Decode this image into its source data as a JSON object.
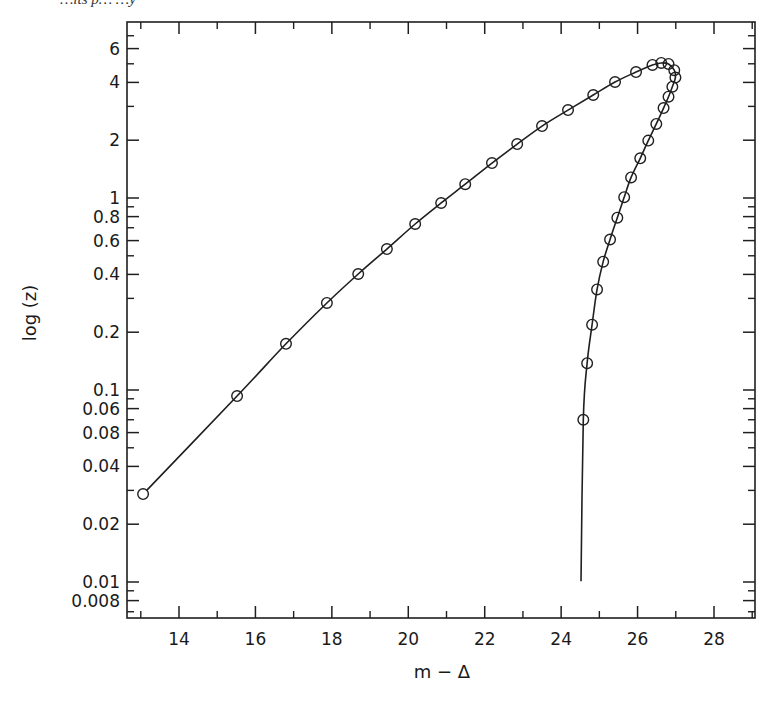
{
  "caption": "…its p…        …y",
  "chart_data": {
    "type": "line",
    "title": "",
    "xlabel": "m − Δ",
    "ylabel": "log (z)",
    "xlim": [
      12.6,
      29.1
    ],
    "ylim": [
      0.0063,
      7.6
    ],
    "yscale": "log",
    "grid": false,
    "legend": null,
    "x_ticks": [
      14,
      16,
      18,
      20,
      22,
      24,
      26,
      28
    ],
    "x_tick_labels": [
      "14",
      "16",
      "18",
      "20",
      "22",
      "24",
      "26",
      "28"
    ],
    "x_minor_ticks": [
      13,
      15,
      17,
      19,
      21,
      23,
      25,
      27,
      29
    ],
    "y_ticks": [
      {
        "value": 6,
        "label": "6"
      },
      {
        "value": 4,
        "label": "4"
      },
      {
        "value": 2,
        "label": "2"
      },
      {
        "value": 1,
        "label": "1"
      },
      {
        "value": 0.8,
        "label": "0.8"
      },
      {
        "value": 0.6,
        "label": "0.6"
      },
      {
        "value": 0.4,
        "label": "0.4"
      },
      {
        "value": 0.2,
        "label": "0.2"
      },
      {
        "value": 0.1,
        "label": "0.1"
      },
      {
        "value": 0.08,
        "label": "0.06"
      },
      {
        "value": 0.06,
        "label": "0.08"
      },
      {
        "value": 0.04,
        "label": "0.04"
      },
      {
        "value": 0.02,
        "label": "0.02"
      },
      {
        "value": 0.01,
        "label": "0.01"
      },
      {
        "value": 0.008,
        "label": "0.008"
      }
    ],
    "y_minor_ticks": [
      7,
      5,
      3,
      0.9,
      0.7,
      0.5,
      0.3,
      0.09,
      0.07,
      0.05,
      0.03,
      0.009,
      0.007
    ],
    "series": [
      {
        "name": "curve",
        "style": "solid line with open circle markers",
        "points": [
          {
            "x": 13.06,
            "y": 0.0287,
            "marker": true
          },
          {
            "x": 15.52,
            "y": 0.093,
            "marker": true
          },
          {
            "x": 16.8,
            "y": 0.174,
            "marker": true
          },
          {
            "x": 17.87,
            "y": 0.284,
            "marker": true
          },
          {
            "x": 18.69,
            "y": 0.402,
            "marker": true
          },
          {
            "x": 19.44,
            "y": 0.542,
            "marker": true
          },
          {
            "x": 20.18,
            "y": 0.732,
            "marker": true
          },
          {
            "x": 20.86,
            "y": 0.942,
            "marker": true
          },
          {
            "x": 21.49,
            "y": 1.18,
            "marker": true
          },
          {
            "x": 22.19,
            "y": 1.52,
            "marker": true
          },
          {
            "x": 22.85,
            "y": 1.91,
            "marker": true
          },
          {
            "x": 23.5,
            "y": 2.37,
            "marker": true
          },
          {
            "x": 24.18,
            "y": 2.87,
            "marker": true
          },
          {
            "x": 24.84,
            "y": 3.44,
            "marker": true
          },
          {
            "x": 25.41,
            "y": 4.02,
            "marker": true
          },
          {
            "x": 25.96,
            "y": 4.53,
            "marker": true
          },
          {
            "x": 26.39,
            "y": 4.93,
            "marker": true
          },
          {
            "x": 26.62,
            "y": 5.05,
            "marker": true
          },
          {
            "x": 26.81,
            "y": 4.99,
            "marker": true
          },
          {
            "x": 26.96,
            "y": 4.63,
            "marker": true
          },
          {
            "x": 26.99,
            "y": 4.24,
            "marker": true
          },
          {
            "x": 26.91,
            "y": 3.8,
            "marker": true
          },
          {
            "x": 26.81,
            "y": 3.37,
            "marker": true
          },
          {
            "x": 26.68,
            "y": 2.94,
            "marker": true
          },
          {
            "x": 26.49,
            "y": 2.43,
            "marker": true
          },
          {
            "x": 26.28,
            "y": 1.99,
            "marker": true
          },
          {
            "x": 26.07,
            "y": 1.61,
            "marker": true
          },
          {
            "x": 25.83,
            "y": 1.28,
            "marker": true
          },
          {
            "x": 25.65,
            "y": 1.01,
            "marker": true
          },
          {
            "x": 25.47,
            "y": 0.79,
            "marker": true
          },
          {
            "x": 25.28,
            "y": 0.608,
            "marker": true
          },
          {
            "x": 25.1,
            "y": 0.466,
            "marker": true
          },
          {
            "x": 24.94,
            "y": 0.334,
            "marker": true
          },
          {
            "x": 24.81,
            "y": 0.219,
            "marker": true
          },
          {
            "x": 24.68,
            "y": 0.138,
            "marker": true
          },
          {
            "x": 24.58,
            "y": 0.07,
            "marker": true
          },
          {
            "x": 24.52,
            "y": 0.0101,
            "marker": false
          }
        ]
      }
    ]
  }
}
